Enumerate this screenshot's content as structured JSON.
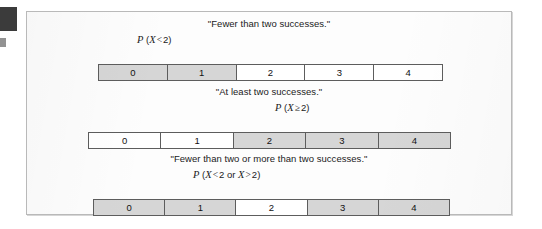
{
  "figure": {
    "margin_marker": "black-tab-marker",
    "panels": [
      {
        "title": "\"Fewer than two successes.\"",
        "probability": {
          "p": "P",
          "open": " (",
          "variable": "X",
          "operator": "<",
          "value": "2",
          "close": ")",
          "full_text": "P (X < 2)"
        },
        "cells": [
          {
            "label": "0",
            "shaded": true
          },
          {
            "label": "1",
            "shaded": true
          },
          {
            "label": "2",
            "shaded": false
          },
          {
            "label": "3",
            "shaded": false
          },
          {
            "label": "4",
            "shaded": false
          }
        ]
      },
      {
        "title": "\"At least two successes.\"",
        "probability": {
          "p": "P",
          "open": " (",
          "variable": "X",
          "operator": "≥",
          "value": "2",
          "close": ")",
          "full_text": "P (X ≥ 2)"
        },
        "cells": [
          {
            "label": "0",
            "shaded": false
          },
          {
            "label": "1",
            "shaded": false
          },
          {
            "label": "2",
            "shaded": true
          },
          {
            "label": "3",
            "shaded": true
          },
          {
            "label": "4",
            "shaded": true
          }
        ]
      },
      {
        "title": "\"Fewer than two or more than two successes.\"",
        "probability": {
          "p": "P",
          "open": " (",
          "variable": "X",
          "operator": "<",
          "value": "2",
          "conjunction": "or",
          "variable2": "X",
          "operator2": ">",
          "value2": "2",
          "close": ")",
          "full_text": "P (X < 2 or X > 2)"
        },
        "cells": [
          {
            "label": "0",
            "shaded": true
          },
          {
            "label": "1",
            "shaded": true
          },
          {
            "label": "2",
            "shaded": false
          },
          {
            "label": "3",
            "shaded": true
          },
          {
            "label": "4",
            "shaded": true
          }
        ]
      }
    ],
    "colors": {
      "shaded_cell": "#d6d6d6",
      "plain_cell": "#ffffff",
      "cell_border": "#5d5d5d",
      "frame_border": "#b9b9b9",
      "text": "#1b1b1b",
      "margin_marker": "#3b3b3b"
    }
  }
}
